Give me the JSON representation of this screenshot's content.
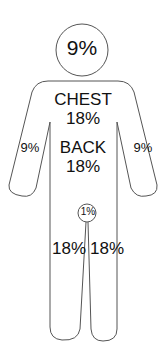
{
  "diagram": {
    "type": "rule-of-nines body chart",
    "line_color": "#555555",
    "regions": {
      "head": {
        "percent": "9%"
      },
      "chest": {
        "label": "CHEST",
        "percent": "18%"
      },
      "back": {
        "label": "BACK",
        "percent": "18%"
      },
      "left_arm": {
        "percent": "9%"
      },
      "right_arm": {
        "percent": "9%"
      },
      "groin": {
        "percent": "1%"
      },
      "left_leg": {
        "percent": "18%"
      },
      "right_leg": {
        "percent": "18%"
      }
    }
  }
}
